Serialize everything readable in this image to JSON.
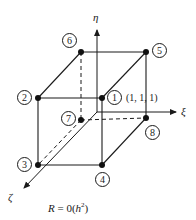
{
  "diagram": {
    "axes": {
      "eta": "η",
      "xi": "ξ",
      "zeta": "ζ"
    },
    "nodes": [
      {
        "id": "1",
        "x": 102,
        "y": 98
      },
      {
        "id": "2",
        "x": 38,
        "y": 98
      },
      {
        "id": "3",
        "x": 38,
        "y": 165
      },
      {
        "id": "4",
        "x": 102,
        "y": 165
      },
      {
        "id": "5",
        "x": 146,
        "y": 52
      },
      {
        "id": "6",
        "x": 81,
        "y": 52
      },
      {
        "id": "7",
        "x": 81,
        "y": 120
      },
      {
        "id": "8",
        "x": 146,
        "y": 118
      }
    ],
    "node1_coordinate": "(1, 1, 1)",
    "formula": "R = 0(h²)",
    "line_color": "#1a1a1a"
  }
}
